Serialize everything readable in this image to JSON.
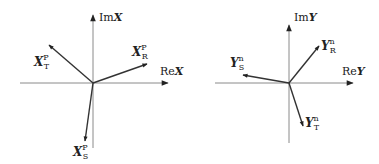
{
  "diagrams": [
    {
      "name": "phasor-diagram-x-positive-sequence",
      "axes": {
        "im_label_prefix": "Im",
        "im_label_var": "X",
        "re_label_prefix": "Re",
        "re_label_var": "X"
      },
      "vectors": [
        {
          "id": "R",
          "base": "X",
          "sub": "R",
          "sup": "P"
        },
        {
          "id": "S",
          "base": "X",
          "sub": "S",
          "sup": "P"
        },
        {
          "id": "T",
          "base": "X",
          "sub": "T",
          "sup": "P"
        }
      ]
    },
    {
      "name": "phasor-diagram-y-negative-sequence",
      "axes": {
        "im_label_prefix": "Im",
        "im_label_var": "Y",
        "re_label_prefix": "Re",
        "re_label_var": "Y"
      },
      "vectors": [
        {
          "id": "R",
          "base": "Y",
          "sub": "R",
          "sup": "n"
        },
        {
          "id": "S",
          "base": "Y",
          "sub": "S",
          "sup": "n"
        },
        {
          "id": "T",
          "base": "Y",
          "sub": "T",
          "sup": "n"
        }
      ]
    }
  ],
  "colors": {
    "axis": "#8a8a8a",
    "vector": "#333333",
    "text": "#222222"
  }
}
